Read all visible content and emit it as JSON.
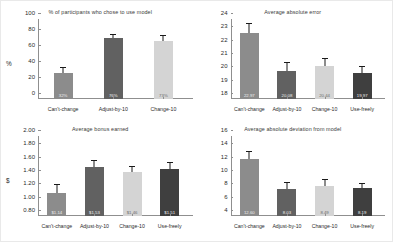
{
  "figure": {
    "background": "#ffffff",
    "palette": {
      "cant_change": "#8c8c8c",
      "adjust_by_10": "#616161",
      "change_10": "#d4d4d4",
      "use_freely": "#3f3f3f",
      "axis": "#8f8f8f",
      "error_bar": "#1a1a1a",
      "text": "#2b2b2b"
    }
  },
  "chart_data": [
    {
      "type": "bar",
      "panel": "top-left",
      "title": "% of participants who chose to use model",
      "xlabel": "",
      "ylabel": "%",
      "categories": [
        "Can't-change",
        "Adjust-by-10",
        "Change-10"
      ],
      "values": [
        32,
        76,
        73
      ],
      "data_labels": [
        "32%",
        "76%",
        "73%"
      ],
      "errors": [
        6.5,
        4.5,
        5.5
      ],
      "ylim": [
        0,
        100
      ],
      "yticks": [
        0,
        20,
        40,
        60,
        80,
        100
      ],
      "ytick_labels": [
        "0",
        "20",
        "40",
        "60",
        "80",
        "100"
      ],
      "grid": false,
      "legend": "none",
      "bar_colors": [
        "#8c8c8c",
        "#616161",
        "#d4d4d4"
      ]
    },
    {
      "type": "bar",
      "panel": "top-right",
      "title": "Average absolute error",
      "xlabel": "",
      "ylabel": "",
      "categories": [
        "Can't-change",
        "Adjust-by-10",
        "Change-10",
        "Use-freely"
      ],
      "values": [
        22.97,
        20.08,
        20.44,
        19.97
      ],
      "data_labels": [
        "22.97",
        "20.08",
        "20.44",
        "19.97"
      ],
      "errors": [
        0.62,
        0.62,
        0.58,
        0.45
      ],
      "ylim": [
        18,
        24
      ],
      "yticks": [
        18,
        19,
        20,
        21,
        22,
        23,
        24
      ],
      "ytick_labels": [
        "18",
        "19",
        "20",
        "21",
        "22",
        "23",
        "24"
      ],
      "grid": false,
      "legend": "none",
      "bar_colors": [
        "#8c8c8c",
        "#616161",
        "#d4d4d4",
        "#3f3f3f"
      ]
    },
    {
      "type": "bar",
      "panel": "bottom-left",
      "title": "Average bonus earned",
      "xlabel": "",
      "ylabel": "$",
      "categories": [
        "Can't-change",
        "Adjust-by-10",
        "Change-10",
        "Use-freely"
      ],
      "values": [
        1.14,
        1.53,
        1.46,
        1.51
      ],
      "data_labels": [
        "$1.14",
        "$1.53",
        "$1.46",
        "$1.51"
      ],
      "errors": [
        0.12,
        0.09,
        0.08,
        0.09
      ],
      "ylim": [
        0.8,
        2.0
      ],
      "yticks": [
        0.8,
        1.0,
        1.2,
        1.4,
        1.6,
        1.8,
        2.0
      ],
      "ytick_labels": [
        "0.80",
        "1.00",
        "1.20",
        "1.40",
        "1.60",
        "1.80",
        "2.00"
      ],
      "grid": false,
      "legend": "none",
      "bar_colors": [
        "#8c8c8c",
        "#616161",
        "#d4d4d4",
        "#3f3f3f"
      ]
    },
    {
      "type": "bar",
      "panel": "bottom-right",
      "title": "Average absolute deviation from model",
      "xlabel": "",
      "ylabel": "",
      "categories": [
        "Can't-change",
        "Adjust-by-10",
        "Change-10",
        "Use-freely"
      ],
      "values": [
        12.6,
        8.03,
        8.49,
        8.19
      ],
      "data_labels": [
        "12.60",
        "8.03",
        "8.49",
        "8.19"
      ],
      "errors": [
        1.0,
        0.95,
        0.85,
        0.65
      ],
      "ylim": [
        4,
        16
      ],
      "yticks": [
        4,
        6,
        8,
        10,
        12,
        14,
        16
      ],
      "ytick_labels": [
        "4",
        "6",
        "8",
        "10",
        "12",
        "14",
        "16"
      ],
      "grid": false,
      "legend": "none",
      "bar_colors": [
        "#8c8c8c",
        "#616161",
        "#d4d4d4",
        "#3f3f3f"
      ]
    }
  ]
}
